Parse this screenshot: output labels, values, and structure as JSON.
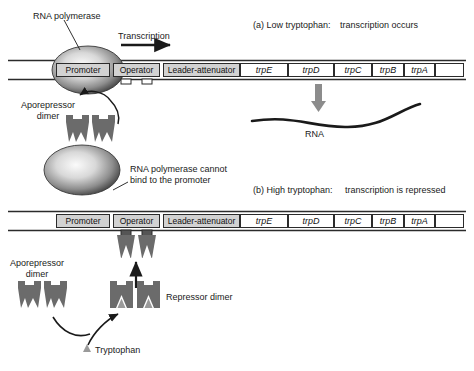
{
  "figure": {
    "type": "diagram"
  },
  "panel_a": {
    "id": "(a)",
    "condition": "(a) Low tryptophan:",
    "outcome": "transcription occurs",
    "transcription_label": "Transcription",
    "rna_label": "RNA",
    "polymerase_label": "RNA polymerase",
    "aporepressor_label": "Aporepressor\ndimer"
  },
  "panel_b": {
    "id": "(b)",
    "condition": "(b) High tryptophan:",
    "outcome": "transcription is repressed",
    "cannot_bind_label": "RNA polymerase cannot\nbind to the promoter",
    "aporepressor_label": "Aporepressor\ndimer",
    "repressor_label": "Repressor dimer",
    "tryptophan_label": "Tryptophan"
  },
  "operon_top": {
    "segments": [
      {
        "name": "promoter",
        "label": "Promoter",
        "italic": false,
        "shaded": true,
        "x": 56,
        "w": 54
      },
      {
        "name": "operator",
        "label": "Operator",
        "italic": false,
        "shaded": true,
        "x": 113,
        "w": 47
      },
      {
        "name": "leader-attenuator",
        "label": "Leader-attenuator",
        "italic": false,
        "shaded": true,
        "x": 163,
        "w": 77
      },
      {
        "name": "trpE",
        "label": "trpE",
        "italic": true,
        "shaded": false,
        "x": 240,
        "w": 48
      },
      {
        "name": "trpD",
        "label": "trpD",
        "italic": true,
        "shaded": false,
        "x": 288,
        "w": 46
      },
      {
        "name": "trpC",
        "label": "trpC",
        "italic": true,
        "shaded": false,
        "x": 334,
        "w": 38
      },
      {
        "name": "trpB",
        "label": "trpB",
        "italic": true,
        "shaded": false,
        "x": 372,
        "w": 32
      },
      {
        "name": "trpA",
        "label": "trpA",
        "italic": true,
        "shaded": false,
        "x": 404,
        "w": 31
      },
      {
        "name": "downstream",
        "label": "",
        "italic": false,
        "shaded": false,
        "x": 435,
        "w": 29
      }
    ]
  },
  "operon_bottom": {
    "segments": [
      {
        "name": "promoter",
        "label": "Promoter",
        "italic": false,
        "shaded": true,
        "x": 56,
        "w": 54
      },
      {
        "name": "operator",
        "label": "Operator",
        "italic": false,
        "shaded": true,
        "x": 113,
        "w": 47
      },
      {
        "name": "leader-attenuator",
        "label": "Leader-attenuator",
        "italic": false,
        "shaded": true,
        "x": 163,
        "w": 77
      },
      {
        "name": "trpE",
        "label": "trpE",
        "italic": true,
        "shaded": false,
        "x": 240,
        "w": 48
      },
      {
        "name": "trpD",
        "label": "trpD",
        "italic": true,
        "shaded": false,
        "x": 288,
        "w": 46
      },
      {
        "name": "trpC",
        "label": "trpC",
        "italic": true,
        "shaded": false,
        "x": 334,
        "w": 38
      },
      {
        "name": "trpB",
        "label": "trpB",
        "italic": true,
        "shaded": false,
        "x": 372,
        "w": 32
      },
      {
        "name": "trpA",
        "label": "trpA",
        "italic": true,
        "shaded": false,
        "x": 404,
        "w": 31
      },
      {
        "name": "downstream",
        "label": "",
        "italic": false,
        "shaded": false,
        "x": 435,
        "w": 29
      }
    ]
  },
  "colors": {
    "dna_line": "#2b2b2b",
    "box_fill": "#ffffff",
    "box_shaded": "#d2d2d2",
    "box_stroke": "#2b2b2b",
    "repressor": "#6b6b6b",
    "tryptophan": "#9a9a9a",
    "arrow_gray": "#8c8c8c",
    "rna_strand": "#1a1a1a",
    "polymerase_light": "#f2f2f2",
    "polymerase_dark": "#555555",
    "text": "#1a1a1a"
  }
}
